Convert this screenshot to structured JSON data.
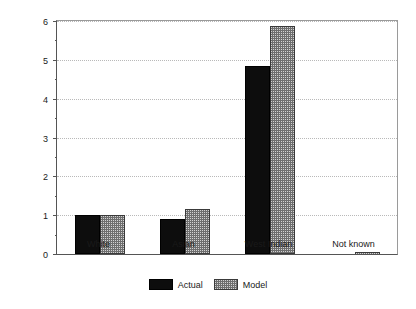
{
  "chart_data": {
    "type": "bar",
    "title": "",
    "xlabel": "",
    "ylabel": "Relative risk ratio (white=1)",
    "categories": [
      "White",
      "Asian",
      "West Indian",
      "Not known"
    ],
    "series": [
      {
        "name": "Actual",
        "color": "#0d0d0d",
        "fill": "solid-black",
        "values": [
          1.0,
          0.9,
          4.85,
          0.0
        ]
      },
      {
        "name": "Model",
        "color": "#d2d2d2",
        "fill": "checkerboard-gray",
        "values": [
          1.0,
          1.15,
          5.87,
          0.02
        ]
      }
    ],
    "ylim": [
      0,
      6
    ],
    "yticks": [
      0,
      1,
      2,
      3,
      4,
      5,
      6
    ],
    "ytick_labels": [
      "0",
      "1",
      "2",
      "3",
      "4",
      "5",
      "6"
    ],
    "minor_yticks": [
      0.5,
      1.5,
      2.5,
      3.5,
      4.5,
      5.5
    ],
    "grid": true,
    "grid_style": "dotted",
    "grid_axis": "y",
    "legend_position": "bottom-center",
    "legend_entries": [
      "Actual",
      "Model"
    ]
  },
  "axes": {
    "y_axis_title": "Relative risk ratio (white=1)"
  },
  "legend": {
    "actual_label": "Actual",
    "model_label": "Model"
  }
}
